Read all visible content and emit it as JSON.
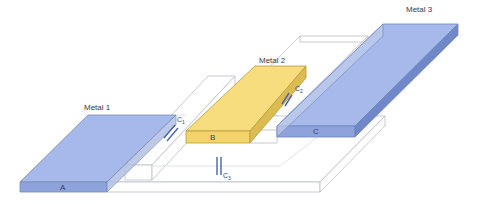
{
  "diagram": {
    "layers": [
      {
        "id": "metal1",
        "label": "Metal 1",
        "face_label": "A",
        "color": "#9fb3e6"
      },
      {
        "id": "metal2",
        "label": "Metal 2",
        "face_label": "B",
        "color": "#f6dc7a"
      },
      {
        "id": "metal3",
        "label": "Metal 3",
        "face_label": "C",
        "color": "#9fb3e6"
      }
    ],
    "capacitors": [
      {
        "id": "c1",
        "label": "C",
        "subscript": "1",
        "between": "Metal 1 – Metal 2"
      },
      {
        "id": "c2",
        "label": "C",
        "subscript": "2",
        "between": "Metal 2 – Metal 3"
      },
      {
        "id": "c3",
        "label": "C",
        "subscript": "3",
        "between": "Metal 1 – Metal 3"
      }
    ],
    "colors": {
      "metal_blue_top": "#a7b9ea",
      "metal_blue_front": "#8ea3dc",
      "metal_blue_side": "#7188c8",
      "metal_yellow_top": "#f7dd7e",
      "metal_yellow_front": "#f3d46a",
      "metal_yellow_side": "#d9b84c",
      "outline": "#7a8ab0",
      "dielectric_outline": "#b8bcc8",
      "capacitor_symbol": "#4a62a8"
    }
  }
}
